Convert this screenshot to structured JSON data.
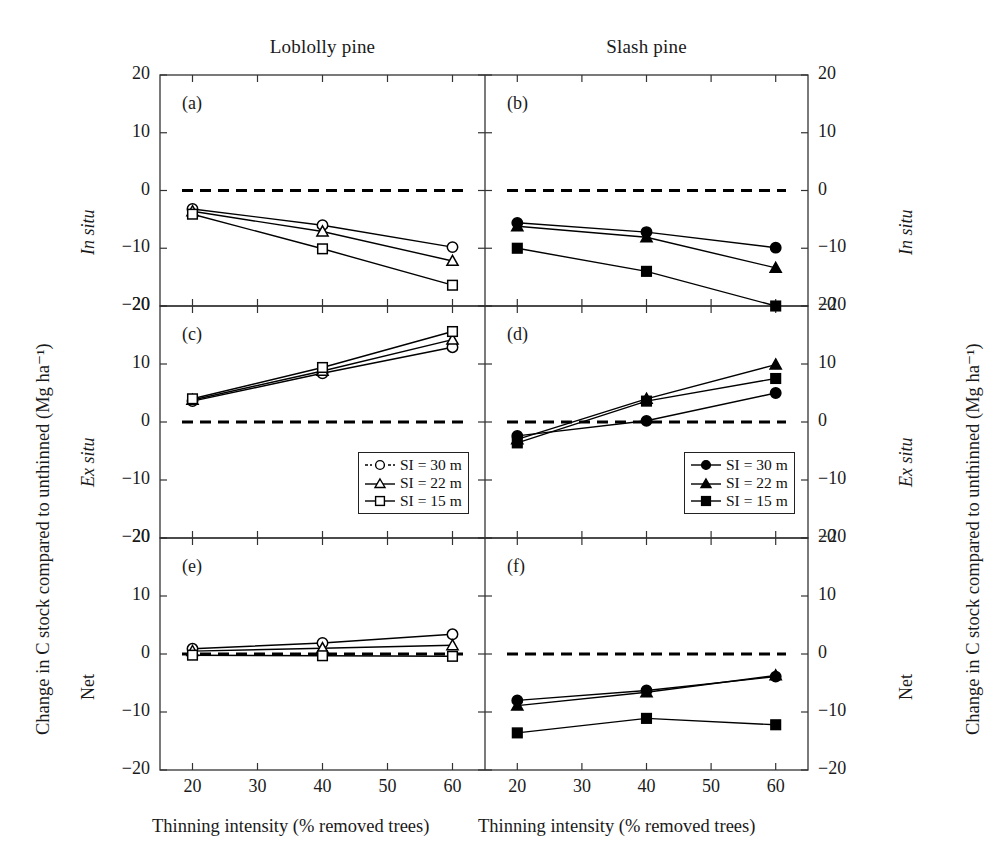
{
  "figure": {
    "column_titles": [
      "Loblolly pine",
      "Slash pine"
    ],
    "y_axis_title": "Change in C stock compared to unthinned (Mg ha⁻¹)",
    "x_axis_title": "Thinning intensity (% removed trees)",
    "row_labels": [
      "In situ",
      "Ex situ",
      "Net"
    ],
    "panel_tags": [
      "(a)",
      "(b)",
      "(c)",
      "(d)",
      "(e)",
      "(f)"
    ],
    "y_ticks": [
      "20",
      "10",
      "0",
      "−10",
      "−20"
    ],
    "x_ticks": [
      "20",
      "30",
      "40",
      "50",
      "60"
    ],
    "zero_line_style": "dashed",
    "line_color": "#000000",
    "background_color": "#ffffff"
  },
  "legends": [
    {
      "panel": "(c)",
      "marker_fill": "open",
      "entries": [
        {
          "marker": "circle",
          "label": "SI = 30 m"
        },
        {
          "marker": "triangle",
          "label": "SI = 22 m"
        },
        {
          "marker": "square",
          "label": "SI = 15 m"
        }
      ]
    },
    {
      "panel": "(d)",
      "marker_fill": "filled",
      "entries": [
        {
          "marker": "circle",
          "label": "SI = 30 m"
        },
        {
          "marker": "triangle",
          "label": "SI = 22 m"
        },
        {
          "marker": "square",
          "label": "SI = 15 m"
        }
      ]
    }
  ],
  "chart_data": {
    "type": "line",
    "xlabel": "Thinning intensity (% removed trees)",
    "ylabel": "Change in C stock compared to unthinned (Mg ha⁻¹)",
    "x": [
      20,
      40,
      60
    ],
    "xlim": [
      15,
      65
    ],
    "ylim": [
      -20,
      20
    ],
    "yticks": [
      20,
      10,
      0,
      -10,
      -20
    ],
    "xticks": [
      20,
      30,
      40,
      50,
      60
    ],
    "grid": false,
    "reference_line": {
      "y": 0,
      "style": "dashed"
    },
    "panels": [
      {
        "tag": "(a)",
        "column": "Loblolly pine",
        "row": "In situ",
        "marker_fill": "open",
        "series": [
          {
            "name": "SI = 30 m",
            "marker": "circle",
            "values": [
              -3.2,
              -6.0,
              -9.8
            ]
          },
          {
            "name": "SI = 22 m",
            "marker": "triangle",
            "values": [
              -3.6,
              -7.1,
              -12.2
            ]
          },
          {
            "name": "SI = 15 m",
            "marker": "square",
            "values": [
              -4.1,
              -10.1,
              -16.4
            ]
          }
        ]
      },
      {
        "tag": "(b)",
        "column": "Slash pine",
        "row": "In situ",
        "marker_fill": "filled",
        "series": [
          {
            "name": "SI = 30 m",
            "marker": "circle",
            "values": [
              -5.6,
              -7.2,
              -9.9
            ]
          },
          {
            "name": "SI = 22 m",
            "marker": "triangle",
            "values": [
              -6.2,
              -8.1,
              -13.4
            ]
          },
          {
            "name": "SI = 15 m",
            "marker": "square",
            "values": [
              -10.0,
              -14.0,
              -20.0
            ]
          }
        ]
      },
      {
        "tag": "(c)",
        "column": "Loblolly pine",
        "row": "Ex situ",
        "marker_fill": "open",
        "series": [
          {
            "name": "SI = 30 m",
            "marker": "circle",
            "values": [
              3.6,
              8.4,
              12.9
            ]
          },
          {
            "name": "SI = 22 m",
            "marker": "triangle",
            "values": [
              3.8,
              8.8,
              14.2
            ]
          },
          {
            "name": "SI = 15 m",
            "marker": "square",
            "values": [
              4.0,
              9.4,
              15.6
            ]
          }
        ]
      },
      {
        "tag": "(d)",
        "column": "Slash pine",
        "row": "Ex situ",
        "marker_fill": "filled",
        "series": [
          {
            "name": "SI = 30 m",
            "marker": "circle",
            "values": [
              -2.4,
              0.2,
              5.0
            ]
          },
          {
            "name": "SI = 22 m",
            "marker": "triangle",
            "values": [
              -3.0,
              4.0,
              9.9
            ]
          },
          {
            "name": "SI = 15 m",
            "marker": "square",
            "values": [
              -3.6,
              3.6,
              7.5
            ]
          }
        ]
      },
      {
        "tag": "(e)",
        "column": "Loblolly pine",
        "row": "Net",
        "marker_fill": "open",
        "series": [
          {
            "name": "SI = 30 m",
            "marker": "circle",
            "values": [
              0.9,
              1.9,
              3.4
            ]
          },
          {
            "name": "SI = 22 m",
            "marker": "triangle",
            "values": [
              0.5,
              1.0,
              1.5
            ]
          },
          {
            "name": "SI = 15 m",
            "marker": "square",
            "values": [
              -0.2,
              -0.3,
              -0.4
            ]
          }
        ]
      },
      {
        "tag": "(f)",
        "column": "Slash pine",
        "row": "Net",
        "marker_fill": "filled",
        "series": [
          {
            "name": "SI = 30 m",
            "marker": "circle",
            "values": [
              -8.0,
              -6.3,
              -3.9
            ]
          },
          {
            "name": "SI = 22 m",
            "marker": "triangle",
            "values": [
              -8.9,
              -6.6,
              -3.7
            ]
          },
          {
            "name": "SI = 15 m",
            "marker": "square",
            "values": [
              -13.6,
              -11.1,
              -12.2
            ]
          }
        ]
      }
    ]
  }
}
